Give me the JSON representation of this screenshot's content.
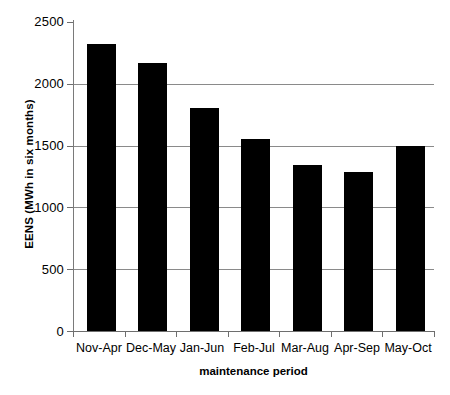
{
  "chart_data": {
    "type": "bar",
    "title": "",
    "subtitle": "",
    "xlabel": "maintenance period",
    "ylabel": "EENS (MWh in six months)",
    "categories": [
      "Nov-Apr",
      "Dec-May",
      "Jan-Jun",
      "Feb-Jul",
      "Mar-Aug",
      "Apr-Sep",
      "May-Oct"
    ],
    "values": [
      2320,
      2165,
      1805,
      1555,
      1340,
      1285,
      1500
    ],
    "series": [
      {
        "name": "EENS",
        "values": [
          2320,
          2165,
          1805,
          1555,
          1340,
          1285,
          1500
        ]
      }
    ],
    "ylim": [
      0,
      2500
    ],
    "ytick_labels": [
      "0",
      "500",
      "1000",
      "1500",
      "2000",
      "2500"
    ],
    "ytick_values": [
      0,
      500,
      1000,
      1500,
      2000,
      2500
    ],
    "grid": true,
    "grid_axis": "y",
    "legend": false,
    "legend_position": "none",
    "bar_color": "#000000",
    "grid_color": "#8a8a8a",
    "axis_color": "#6e6e6e",
    "background_color": "#ffffff"
  },
  "caption": {
    "text": ""
  }
}
